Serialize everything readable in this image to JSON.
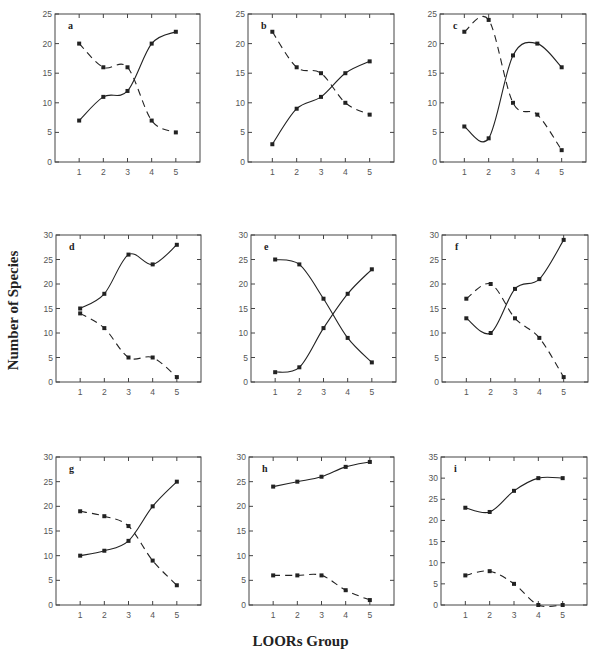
{
  "figure": {
    "ylabel": "Number of Species",
    "xlabel": "LOORs Group"
  },
  "chart_data": [
    {
      "type": "line",
      "panel": "a",
      "categories": [
        1,
        2,
        3,
        4,
        5
      ],
      "ylim": [
        0,
        25
      ],
      "yticks": [
        0,
        5,
        10,
        15,
        20,
        25
      ],
      "series": [
        {
          "name": "solid",
          "style": "solid",
          "values": [
            7,
            11,
            12,
            20,
            22
          ]
        },
        {
          "name": "dashed",
          "style": "dashed",
          "values": [
            20,
            16,
            16,
            7,
            5
          ]
        }
      ]
    },
    {
      "type": "line",
      "panel": "b",
      "categories": [
        1,
        2,
        3,
        4,
        5
      ],
      "ylim": [
        0,
        25
      ],
      "yticks": [
        0,
        5,
        10,
        15,
        20,
        25
      ],
      "series": [
        {
          "name": "solid",
          "style": "solid",
          "values": [
            3,
            9,
            11,
            15,
            17
          ]
        },
        {
          "name": "dashed",
          "style": "dashed",
          "values": [
            22,
            16,
            15,
            10,
            8
          ]
        }
      ]
    },
    {
      "type": "line",
      "panel": "c",
      "categories": [
        1,
        2,
        3,
        4,
        5
      ],
      "ylim": [
        0,
        25
      ],
      "yticks": [
        0,
        5,
        10,
        15,
        20,
        25
      ],
      "series": [
        {
          "name": "solid",
          "style": "solid",
          "values": [
            6,
            4,
            18,
            20,
            16
          ]
        },
        {
          "name": "dashed",
          "style": "dashed",
          "values": [
            22,
            24,
            10,
            8,
            2
          ]
        }
      ]
    },
    {
      "type": "line",
      "panel": "d",
      "categories": [
        1,
        2,
        3,
        4,
        5
      ],
      "ylim": [
        0,
        30
      ],
      "yticks": [
        0,
        5,
        10,
        15,
        20,
        25,
        30
      ],
      "series": [
        {
          "name": "solid",
          "style": "solid",
          "values": [
            15,
            18,
            26,
            24,
            28
          ]
        },
        {
          "name": "dashed",
          "style": "dashed",
          "values": [
            14,
            11,
            5,
            5,
            1
          ]
        }
      ]
    },
    {
      "type": "line",
      "panel": "e",
      "categories": [
        1,
        2,
        3,
        4,
        5
      ],
      "ylim": [
        0,
        30
      ],
      "yticks": [
        0,
        5,
        10,
        15,
        20,
        25,
        30
      ],
      "series": [
        {
          "name": "increasing",
          "style": "solid",
          "values": [
            2,
            3,
            11,
            18,
            23
          ]
        },
        {
          "name": "decreasing",
          "style": "solid",
          "values": [
            25,
            24,
            17,
            9,
            4
          ]
        }
      ]
    },
    {
      "type": "line",
      "panel": "f",
      "categories": [
        1,
        2,
        3,
        4,
        5
      ],
      "ylim": [
        0,
        30
      ],
      "yticks": [
        0,
        5,
        10,
        15,
        20,
        25,
        30
      ],
      "series": [
        {
          "name": "solid",
          "style": "solid",
          "values": [
            13,
            10,
            19,
            21,
            29
          ]
        },
        {
          "name": "dashed",
          "style": "dashed",
          "values": [
            17,
            20,
            13,
            9,
            1
          ]
        }
      ]
    },
    {
      "type": "line",
      "panel": "g",
      "categories": [
        1,
        2,
        3,
        4,
        5
      ],
      "ylim": [
        0,
        30
      ],
      "yticks": [
        0,
        5,
        10,
        15,
        20,
        25,
        30
      ],
      "series": [
        {
          "name": "solid",
          "style": "solid",
          "values": [
            10,
            11,
            13,
            20,
            25
          ]
        },
        {
          "name": "dashed",
          "style": "dashed",
          "values": [
            19,
            18,
            16,
            9,
            4
          ]
        }
      ]
    },
    {
      "type": "line",
      "panel": "h",
      "categories": [
        1,
        2,
        3,
        4,
        5
      ],
      "ylim": [
        0,
        30
      ],
      "yticks": [
        0,
        5,
        10,
        15,
        20,
        25,
        30
      ],
      "series": [
        {
          "name": "solid",
          "style": "solid",
          "values": [
            24,
            25,
            26,
            28,
            29
          ]
        },
        {
          "name": "dashed",
          "style": "dashed",
          "values": [
            6,
            6,
            6,
            3,
            1
          ]
        }
      ]
    },
    {
      "type": "line",
      "panel": "i",
      "categories": [
        1,
        2,
        3,
        4,
        5
      ],
      "ylim": [
        0,
        35
      ],
      "yticks": [
        0,
        5,
        10,
        15,
        20,
        25,
        30,
        35
      ],
      "series": [
        {
          "name": "solid",
          "style": "solid",
          "values": [
            23,
            22,
            27,
            30,
            30
          ]
        },
        {
          "name": "dashed",
          "style": "dashed",
          "values": [
            7,
            8,
            5,
            0,
            0
          ]
        }
      ]
    }
  ],
  "layout": {
    "panels": [
      {
        "x0": 55,
        "x1": 200,
        "y0": 14,
        "y1": 162
      },
      {
        "x0": 248,
        "x1": 394,
        "y0": 14,
        "y1": 162
      },
      {
        "x0": 440,
        "x1": 586,
        "y0": 14,
        "y1": 162
      },
      {
        "x0": 56,
        "x1": 201,
        "y0": 235,
        "y1": 382
      },
      {
        "x0": 251,
        "x1": 396,
        "y0": 235,
        "y1": 382
      },
      {
        "x0": 442,
        "x1": 588,
        "y0": 235,
        "y1": 382
      },
      {
        "x0": 56,
        "x1": 201,
        "y0": 457,
        "y1": 605
      },
      {
        "x0": 249,
        "x1": 394,
        "y0": 457,
        "y1": 605
      },
      {
        "x0": 441,
        "x1": 587,
        "y0": 457,
        "y1": 605
      }
    ],
    "xmin": 0,
    "xmax": 6,
    "line_color": "#222222",
    "frame_color": "#444444"
  }
}
